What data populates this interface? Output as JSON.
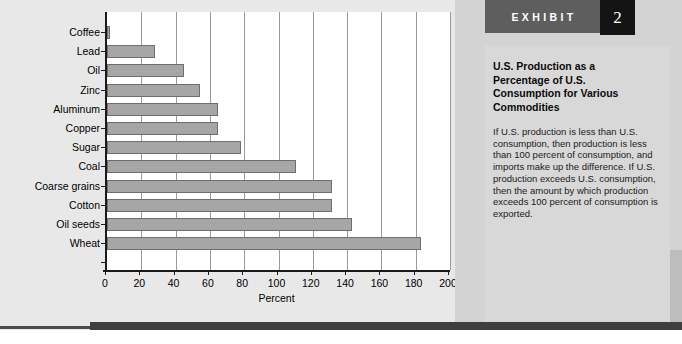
{
  "chart_data": {
    "type": "bar",
    "orientation": "horizontal",
    "title": "",
    "xlabel": "Percent",
    "ylabel": "",
    "xlim": [
      0,
      200
    ],
    "xticks": [
      0,
      20,
      40,
      60,
      80,
      100,
      120,
      140,
      160,
      180,
      200
    ],
    "grid": true,
    "legend": "none",
    "categories": [
      "Coffee",
      "Lead",
      "Oil",
      "Zinc",
      "Aluminum",
      "Copper",
      "Sugar",
      "Coal",
      "Coarse grains",
      "Cotton",
      "Oil seeds",
      "Wheat"
    ],
    "values": [
      2,
      28,
      45,
      54,
      65,
      65,
      78,
      110,
      131,
      131,
      143,
      183
    ],
    "bar_color": "#a6a6a6",
    "bar_border_color": "#6e6e6e"
  },
  "chart": {
    "axis_title": "Percent",
    "ticks": [
      "0",
      "20",
      "40",
      "60",
      "80",
      "100",
      "120",
      "140",
      "160",
      "180",
      "200"
    ],
    "bars": [
      {
        "label": "Coffee",
        "value": 2
      },
      {
        "label": "Lead",
        "value": 28
      },
      {
        "label": "Oil",
        "value": 45
      },
      {
        "label": "Zinc",
        "value": 54
      },
      {
        "label": "Aluminum",
        "value": 65
      },
      {
        "label": "Copper",
        "value": 65
      },
      {
        "label": "Sugar",
        "value": 78
      },
      {
        "label": "Coal",
        "value": 110
      },
      {
        "label": "Coarse grains",
        "value": 131
      },
      {
        "label": "Cotton",
        "value": 131
      },
      {
        "label": "Oil seeds",
        "value": 143
      },
      {
        "label": "Wheat",
        "value": 183
      }
    ]
  },
  "exhibit": {
    "banner_label": "EXHIBIT",
    "number": "2",
    "title": "U.S. Production as a Percentage of U.S. Consumption for Various Commodities",
    "body": "If U.S. production is less than U.S. consumption, then production is less than 100 percent of consumption, and imports make up the difference. If U.S. production exceeds U.S. consumption, then the amount by which production exceeds 100 percent of consumption is exported."
  },
  "colors": {
    "banner_gray": "#5e5e5e",
    "number_box_black": "#141414",
    "panel_gray": "#d3d3d3",
    "chart_bg": "#e8e8e8",
    "bar_fill": "#a6a6a6"
  },
  "source": {
    "text": ""
  }
}
